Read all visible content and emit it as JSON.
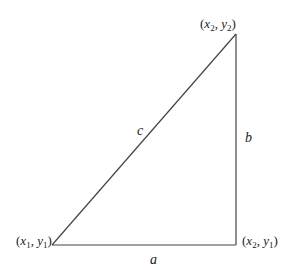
{
  "diagram": {
    "type": "right-triangle",
    "vertices": {
      "bottom_left": {
        "x_var": "x",
        "x_sub": "1",
        "y_var": "y",
        "y_sub": "1"
      },
      "bottom_right": {
        "x_var": "x",
        "x_sub": "2",
        "y_var": "y",
        "y_sub": "1"
      },
      "top_right": {
        "x_var": "x",
        "x_sub": "2",
        "y_var": "y",
        "y_sub": "2"
      }
    },
    "sides": {
      "base": "a",
      "height": "b",
      "hypotenuse": "c"
    },
    "line_color": "#444444",
    "text_color": "#222222"
  }
}
